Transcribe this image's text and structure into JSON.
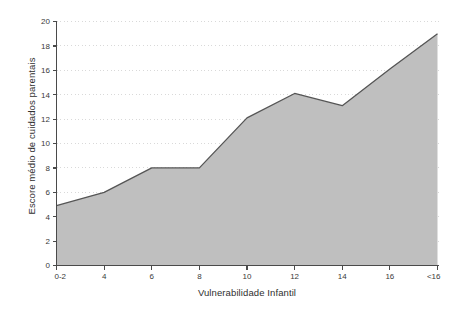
{
  "chart_data": {
    "type": "area",
    "title": "",
    "xlabel": "Vulnerabilidade Infantil",
    "ylabel": "Escore médio de cuidados parentais",
    "categories": [
      "0-2",
      "4",
      "6",
      "8",
      "10",
      "12",
      "14",
      "16",
      "<16"
    ],
    "values": [
      4.9,
      6.0,
      8.0,
      8.0,
      12.1,
      14.1,
      13.1,
      16.1,
      19.0
    ],
    "series": [
      {
        "name": "Escore médio de cuidados parentais",
        "values": [
          4.9,
          6.0,
          8.0,
          8.0,
          12.1,
          14.1,
          13.1,
          16.1,
          19.0
        ]
      }
    ],
    "ylim": [
      0,
      20
    ],
    "ytick_step": 2,
    "yticks": [
      "0",
      "2",
      "4",
      "6",
      "8",
      "10",
      "12",
      "14",
      "16",
      "18",
      "20"
    ],
    "xticks": [
      "0-2",
      "4",
      "6",
      "8",
      "10",
      "12",
      "14",
      "16",
      "<16"
    ],
    "grid": "horizontal-dotted",
    "legend": "none",
    "annotations": [],
    "colors": {
      "area_fill": "#bfbfbf",
      "area_line": "#555555",
      "axis": "#4a4a4a",
      "gridline": "#d9d9d9",
      "background": "#ffffff",
      "text": "#3a3a3a"
    }
  }
}
